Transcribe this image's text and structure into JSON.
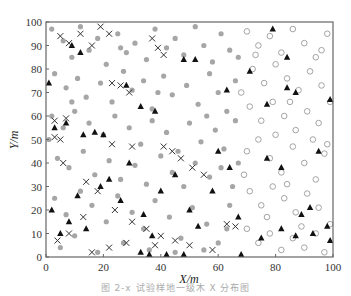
{
  "caption": "图 2-x  试验样地一级木 X 分布图",
  "chart_data": {
    "type": "scatter",
    "title": "",
    "xlabel": "X/m",
    "ylabel": "Y/m",
    "xlim": [
      0,
      100
    ],
    "ylim": [
      0,
      100
    ],
    "xticks": [
      0,
      20,
      40,
      60,
      80,
      100
    ],
    "yticks": [
      0,
      10,
      20,
      30,
      40,
      50,
      60,
      70,
      80,
      90,
      100
    ],
    "grid": false,
    "legend": "none",
    "colors": {
      "gray_dot": "#a6a6a6",
      "hollow_circle": "#9a9a9a",
      "triangle": "#111111",
      "cross": "#333333"
    },
    "series": [
      {
        "name": "gray-filled-dots",
        "marker": "circle-filled",
        "points": [
          [
            2,
            97
          ],
          [
            6,
            92
          ],
          [
            9,
            85
          ],
          [
            12,
            98
          ],
          [
            15,
            88
          ],
          [
            18,
            93
          ],
          [
            21,
            82
          ],
          [
            25,
            95
          ],
          [
            28,
            87
          ],
          [
            31,
            91
          ],
          [
            35,
            84
          ],
          [
            38,
            97
          ],
          [
            42,
            89
          ],
          [
            45,
            93
          ],
          [
            48,
            86
          ],
          [
            52,
            98
          ],
          [
            55,
            90
          ],
          [
            58,
            83
          ],
          [
            61,
            95
          ],
          [
            64,
            88
          ],
          [
            3,
            78
          ],
          [
            7,
            72
          ],
          [
            11,
            76
          ],
          [
            14,
            68
          ],
          [
            19,
            74
          ],
          [
            23,
            66
          ],
          [
            27,
            79
          ],
          [
            30,
            71
          ],
          [
            34,
            75
          ],
          [
            37,
            63
          ],
          [
            41,
            77
          ],
          [
            44,
            69
          ],
          [
            49,
            73
          ],
          [
            53,
            65
          ],
          [
            57,
            78
          ],
          [
            60,
            70
          ],
          [
            63,
            62
          ],
          [
            66,
            75
          ],
          [
            2,
            60
          ],
          [
            6,
            55
          ],
          [
            10,
            62
          ],
          [
            15,
            57
          ],
          [
            20,
            52
          ],
          [
            24,
            60
          ],
          [
            29,
            55
          ],
          [
            33,
            48
          ],
          [
            37,
            58
          ],
          [
            42,
            53
          ],
          [
            46,
            45
          ],
          [
            50,
            57
          ],
          [
            54,
            49
          ],
          [
            59,
            54
          ],
          [
            62,
            46
          ],
          [
            66,
            58
          ],
          [
            4,
            42
          ],
          [
            8,
            38
          ],
          [
            13,
            45
          ],
          [
            17,
            35
          ],
          [
            22,
            41
          ],
          [
            26,
            33
          ],
          [
            31,
            39
          ],
          [
            35,
            31
          ],
          [
            40,
            43
          ],
          [
            44,
            36
          ],
          [
            48,
            30
          ],
          [
            52,
            40
          ],
          [
            57,
            34
          ],
          [
            61,
            38
          ],
          [
            65,
            30
          ],
          [
            3,
            25
          ],
          [
            7,
            18
          ],
          [
            12,
            28
          ],
          [
            16,
            22
          ],
          [
            21,
            15
          ],
          [
            25,
            26
          ],
          [
            30,
            19
          ],
          [
            34,
            12
          ],
          [
            38,
            24
          ],
          [
            43,
            17
          ],
          [
            47,
            8
          ],
          [
            51,
            21
          ],
          [
            56,
            14
          ],
          [
            60,
            6
          ],
          [
            64,
            22
          ],
          [
            5,
            4
          ],
          [
            10,
            9
          ],
          [
            18,
            2
          ],
          [
            27,
            6
          ],
          [
            36,
            3
          ],
          [
            45,
            2
          ],
          [
            55,
            3
          ],
          [
            63,
            12
          ],
          [
            67,
            40
          ],
          [
            67,
            85
          ],
          [
            1,
            50
          ],
          [
            9,
            66
          ],
          [
            26,
            89
          ],
          [
            39,
            70
          ],
          [
            56,
            60
          ]
        ]
      },
      {
        "name": "hollow-circles",
        "marker": "circle-open",
        "points": [
          [
            70,
            96
          ],
          [
            74,
            90
          ],
          [
            78,
            94
          ],
          [
            82,
            87
          ],
          [
            86,
            97
          ],
          [
            90,
            91
          ],
          [
            94,
            85
          ],
          [
            98,
            95
          ],
          [
            72,
            80
          ],
          [
            76,
            74
          ],
          [
            80,
            82
          ],
          [
            84,
            76
          ],
          [
            88,
            71
          ],
          [
            92,
            79
          ],
          [
            96,
            73
          ],
          [
            99,
            66
          ],
          [
            71,
            64
          ],
          [
            75,
            58
          ],
          [
            79,
            66
          ],
          [
            83,
            60
          ],
          [
            87,
            54
          ],
          [
            91,
            62
          ],
          [
            95,
            57
          ],
          [
            98,
            48
          ],
          [
            70,
            45
          ],
          [
            74,
            50
          ],
          [
            78,
            42
          ],
          [
            82,
            36
          ],
          [
            86,
            47
          ],
          [
            90,
            40
          ],
          [
            94,
            33
          ],
          [
            97,
            44
          ],
          [
            71,
            28
          ],
          [
            75,
            22
          ],
          [
            79,
            30
          ],
          [
            83,
            25
          ],
          [
            87,
            19
          ],
          [
            91,
            27
          ],
          [
            95,
            21
          ],
          [
            99,
            14
          ],
          [
            70,
            12
          ],
          [
            74,
            6
          ],
          [
            78,
            10
          ],
          [
            82,
            3
          ],
          [
            86,
            8
          ],
          [
            90,
            4
          ],
          [
            94,
            10
          ],
          [
            97,
            2
          ],
          [
            68,
            70
          ],
          [
            69,
            35
          ],
          [
            73,
            86
          ],
          [
            85,
            66
          ],
          [
            89,
            13
          ],
          [
            93,
            50
          ],
          [
            80,
            52
          ],
          [
            77,
            17
          ],
          [
            96,
            88
          ],
          [
            84,
            31
          ]
        ]
      },
      {
        "name": "black-triangles",
        "marker": "triangle-filled",
        "points": [
          [
            1,
            74
          ],
          [
            9,
            90
          ],
          [
            12,
            87
          ],
          [
            3,
            55
          ],
          [
            7,
            57
          ],
          [
            13,
            52
          ],
          [
            17,
            53
          ],
          [
            20,
            52
          ],
          [
            28,
            73
          ],
          [
            33,
            64
          ],
          [
            38,
            62
          ],
          [
            48,
            84
          ],
          [
            52,
            84
          ],
          [
            63,
            71
          ],
          [
            2,
            20
          ],
          [
            5,
            10
          ],
          [
            8,
            15
          ],
          [
            11,
            26
          ],
          [
            14,
            12
          ],
          [
            19,
            30
          ],
          [
            22,
            33
          ],
          [
            26,
            24
          ],
          [
            29,
            40
          ],
          [
            34,
            18
          ],
          [
            37,
            9
          ],
          [
            40,
            28
          ],
          [
            45,
            35
          ],
          [
            50,
            20
          ],
          [
            53,
            13
          ],
          [
            58,
            28
          ],
          [
            60,
            45
          ],
          [
            64,
            38
          ],
          [
            33,
            2
          ],
          [
            36,
            1
          ],
          [
            42,
            1
          ],
          [
            48,
            1
          ],
          [
            67,
            17
          ],
          [
            68,
            1
          ],
          [
            79,
            97
          ],
          [
            84,
            85
          ],
          [
            71,
            79
          ],
          [
            84,
            72
          ],
          [
            77,
            65
          ],
          [
            87,
            70
          ],
          [
            99,
            67
          ],
          [
            77,
            42
          ],
          [
            95,
            45
          ],
          [
            82,
            38
          ],
          [
            89,
            18
          ],
          [
            98,
            13
          ],
          [
            82,
            12
          ],
          [
            92,
            21
          ],
          [
            99,
            7
          ],
          [
            93,
            10
          ],
          [
            75,
            8
          ],
          [
            87,
            9
          ]
        ]
      },
      {
        "name": "crosses",
        "marker": "cross",
        "points": [
          [
            5,
            94
          ],
          [
            8,
            91
          ],
          [
            12,
            95
          ],
          [
            16,
            90
          ],
          [
            19,
            98
          ],
          [
            22,
            95
          ],
          [
            37,
            93
          ],
          [
            39,
            89
          ],
          [
            41,
            86
          ],
          [
            23,
            74
          ],
          [
            26,
            73
          ],
          [
            29,
            70
          ],
          [
            3,
            58
          ],
          [
            7,
            59
          ],
          [
            3,
            51
          ],
          [
            5,
            50
          ],
          [
            23,
            48
          ],
          [
            30,
            47
          ],
          [
            41,
            47
          ],
          [
            44,
            45
          ],
          [
            47,
            42
          ],
          [
            51,
            38
          ],
          [
            55,
            35
          ],
          [
            6,
            40
          ],
          [
            14,
            32
          ],
          [
            18,
            28
          ],
          [
            24,
            20
          ],
          [
            30,
            15
          ],
          [
            35,
            12
          ],
          [
            40,
            9
          ],
          [
            45,
            7
          ],
          [
            50,
            5
          ],
          [
            58,
            3
          ],
          [
            63,
            14
          ],
          [
            66,
            13
          ],
          [
            4,
            7
          ],
          [
            8,
            10
          ],
          [
            13,
            17
          ],
          [
            16,
            2
          ],
          [
            22,
            4
          ],
          [
            28,
            6
          ],
          [
            38,
            5
          ]
        ]
      }
    ]
  }
}
